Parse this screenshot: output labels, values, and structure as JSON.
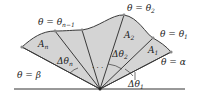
{
  "diagram": {
    "type": "polar-area-sectors",
    "colors": {
      "fill": "#d4d4d4",
      "stroke": "#3a3a3a",
      "baseline": "#333333",
      "point": "#888888"
    },
    "labels": {
      "theta_n_minus_1": {
        "main": "θ = θ",
        "sub": "n−1"
      },
      "theta_2": {
        "main": "θ = θ",
        "sub": "2"
      },
      "theta_1": {
        "main": "θ = θ",
        "sub": "1"
      },
      "theta_alpha": {
        "main": "θ = α"
      },
      "theta_beta": {
        "main": "θ = β"
      },
      "A_n": {
        "main": "A",
        "sub": "n"
      },
      "A_2": {
        "main": "A",
        "sub": "2"
      },
      "A_1": {
        "main": "A",
        "sub": "1"
      },
      "dtheta_n": {
        "main": "Δθ",
        "sub": "n"
      },
      "dtheta_2": {
        "main": "Δθ",
        "sub": "2"
      },
      "dtheta_1": {
        "main": "Δθ",
        "sub": "1"
      },
      "ellipsis": "· · ·"
    }
  }
}
